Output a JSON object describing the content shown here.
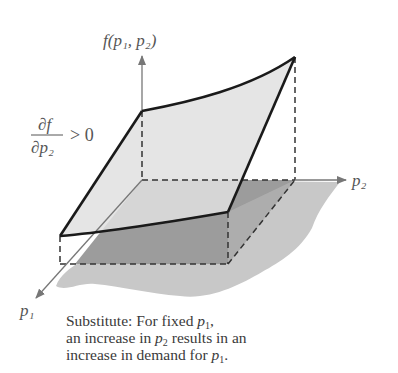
{
  "diagram": {
    "type": "3d-surface-illustration",
    "axes": {
      "vertical_label": "f(p₁, p₂)",
      "horizontal_label": "p₂",
      "depth_label": "p₁"
    },
    "annotation": {
      "numerator": "∂f",
      "denominator": "∂p₂",
      "relation": "> 0"
    },
    "colors": {
      "surface_fill": "#dedede",
      "base_fill": "#9a9a9a",
      "shadow_fill": "#c6c6c6",
      "outline": "#1a1a1a",
      "axis": "#777777"
    }
  },
  "caption": {
    "line1_prefix": "Substitute:  For fixed ",
    "line1_var": "p",
    "line1_sub": "1",
    "line1_suffix": ",",
    "line2_prefix": "an increase in ",
    "line2_var": "p",
    "line2_sub": "2",
    "line2_suffix": " results in an",
    "line3_prefix": "increase in demand for ",
    "line3_var": "p",
    "line3_sub": "1",
    "line3_suffix": "."
  }
}
